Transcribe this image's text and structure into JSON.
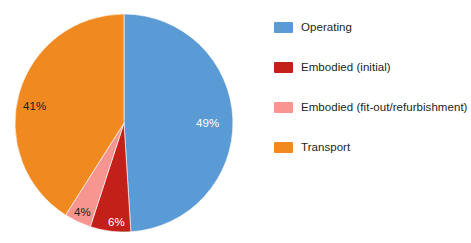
{
  "chart_data": {
    "type": "pie",
    "title": "",
    "subtitle": "",
    "xlabel": "",
    "ylabel": "",
    "grid": false,
    "legend_position": "right",
    "start_angle_oclock": 12,
    "direction": "clockwise",
    "unit": "%",
    "categories": [
      "Operating",
      "Embodied (initial)",
      "Embodied (fit-out/refurbishment)",
      "Transport"
    ],
    "values": [
      49,
      6,
      4,
      41
    ],
    "data_labels": [
      "49%",
      "6%",
      "4%",
      "41%"
    ],
    "colors": [
      "#5B9BD5",
      "#C4201A",
      "#F79690",
      "#F08A20"
    ],
    "slices": [
      {
        "name": "Operating",
        "value": 49,
        "label": "49%",
        "color": "#5B9BD5",
        "label_color": "#ffffff"
      },
      {
        "name": "Embodied (initial)",
        "value": 6,
        "label": "6%",
        "color": "#C4201A",
        "label_color": "#ffffff"
      },
      {
        "name": "Embodied (fit-out/refurbishment)",
        "value": 4,
        "label": "4%",
        "color": "#F79690",
        "label_color": "#231f20"
      },
      {
        "name": "Transport",
        "value": 41,
        "label": "41%",
        "color": "#F08A20",
        "label_color": "#231f20"
      }
    ]
  },
  "legend": {
    "items": [
      {
        "label": "Operating",
        "color": "#5B9BD5"
      },
      {
        "label": "Embodied (initial)",
        "color": "#C4201A"
      },
      {
        "label": "Embodied (fit-out/refurbishment)",
        "color": "#F79690"
      },
      {
        "label": "Transport",
        "color": "#F08A20"
      }
    ]
  }
}
